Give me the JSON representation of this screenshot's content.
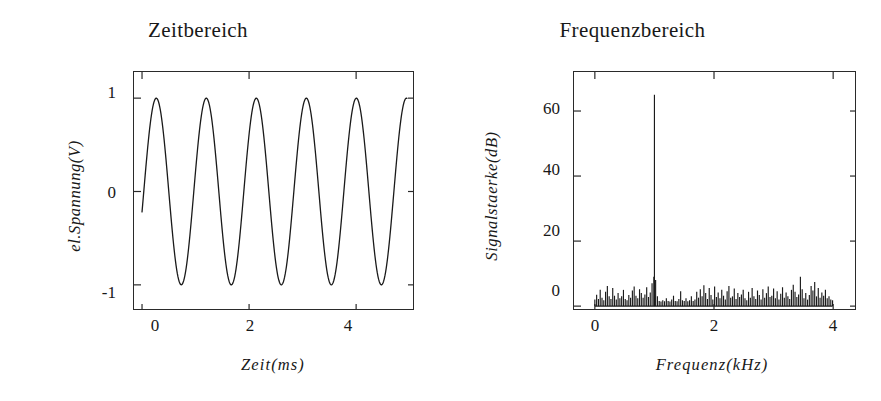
{
  "figure": {
    "background": "#ffffff",
    "ink_color": "#1a1a1a"
  },
  "chart_data": [
    {
      "type": "line",
      "id": "time-domain",
      "title": "Zeitbereich",
      "xlabel": "Zeit(ms)",
      "ylabel": "el.Spannung(V)",
      "xlim": [
        -0.15,
        5.1
      ],
      "ylim": [
        -1.28,
        1.28
      ],
      "xticks": [
        0,
        2,
        4
      ],
      "xticklabels": [
        "0",
        "2",
        "4"
      ],
      "yticks": [
        1,
        0,
        -1
      ],
      "yticklabels": [
        "1",
        "0",
        "-1"
      ],
      "grid": false,
      "legend": "none",
      "series": [
        {
          "name": "signal",
          "description": "sinusoidal voltage, amplitude 1 V, frequency about 1.07 kHz, roughly 5 periods across 5 ms, starting near -0.22 V at t=0",
          "amplitude": 1.0,
          "frequency_khz": 1.07,
          "phase_rad": -0.22,
          "t_start_ms": 0.0,
          "t_end_ms": 4.95,
          "samples": 420,
          "color": "#1a1a1a"
        }
      ]
    },
    {
      "type": "bar",
      "id": "frequency-domain",
      "title": "Frequenzbereich",
      "xlabel": "Frequenz(kHz)",
      "ylabel": "Signalstaerke(dB)",
      "xlim": [
        -0.35,
        4.4
      ],
      "ylim": [
        -1.5,
        72
      ],
      "xticks": [
        0,
        2,
        4
      ],
      "xticklabels": [
        "0",
        "2",
        "4"
      ],
      "yticks": [
        0,
        20,
        40,
        60
      ],
      "yticklabels": [
        "0",
        "20",
        "40",
        "60"
      ],
      "grid": false,
      "legend": "none",
      "peak": {
        "frequency_khz": 1.0,
        "value_db": 65
      },
      "noise_floor_db": 1.5,
      "x": [
        0.0,
        0.03,
        0.06,
        0.09,
        0.12,
        0.15,
        0.18,
        0.21,
        0.24,
        0.27,
        0.3,
        0.33,
        0.36,
        0.39,
        0.42,
        0.45,
        0.48,
        0.51,
        0.54,
        0.57,
        0.6,
        0.63,
        0.66,
        0.69,
        0.72,
        0.75,
        0.78,
        0.81,
        0.84,
        0.87,
        0.9,
        0.93,
        0.96,
        0.99,
        1.0,
        1.02,
        1.05,
        1.08,
        1.11,
        1.14,
        1.17,
        1.2,
        1.23,
        1.26,
        1.29,
        1.32,
        1.35,
        1.38,
        1.41,
        1.44,
        1.47,
        1.5,
        1.53,
        1.56,
        1.59,
        1.62,
        1.65,
        1.68,
        1.71,
        1.74,
        1.77,
        1.8,
        1.83,
        1.86,
        1.89,
        1.92,
        1.95,
        1.98,
        2.01,
        2.04,
        2.07,
        2.1,
        2.13,
        2.16,
        2.19,
        2.22,
        2.25,
        2.28,
        2.31,
        2.34,
        2.37,
        2.4,
        2.43,
        2.46,
        2.49,
        2.52,
        2.55,
        2.58,
        2.61,
        2.64,
        2.67,
        2.7,
        2.73,
        2.76,
        2.79,
        2.82,
        2.85,
        2.88,
        2.91,
        2.94,
        2.97,
        3.0,
        3.03,
        3.06,
        3.09,
        3.12,
        3.15,
        3.18,
        3.21,
        3.24,
        3.27,
        3.3,
        3.33,
        3.36,
        3.39,
        3.42,
        3.45,
        3.48,
        3.51,
        3.54,
        3.57,
        3.6,
        3.63,
        3.66,
        3.69,
        3.72,
        3.75,
        3.78,
        3.81,
        3.84,
        3.87,
        3.9,
        3.93,
        3.96,
        3.99
      ],
      "values": [
        2.0,
        3.5,
        2.2,
        5.0,
        2.6,
        1.8,
        4.4,
        6.2,
        3.0,
        2.2,
        5.6,
        3.2,
        2.0,
        4.0,
        2.4,
        3.0,
        5.0,
        2.2,
        1.8,
        3.4,
        2.6,
        4.8,
        6.0,
        3.2,
        2.4,
        5.2,
        4.0,
        2.6,
        3.6,
        5.8,
        2.8,
        4.2,
        7.0,
        9.0,
        65.0,
        8.0,
        3.0,
        1.6,
        1.4,
        1.8,
        1.5,
        2.4,
        1.6,
        1.4,
        2.0,
        3.2,
        1.6,
        1.5,
        2.2,
        4.6,
        1.8,
        1.6,
        2.4,
        1.5,
        1.8,
        3.0,
        1.6,
        2.0,
        4.4,
        2.6,
        5.2,
        3.0,
        6.4,
        4.0,
        2.2,
        5.6,
        3.4,
        2.0,
        6.0,
        2.8,
        4.2,
        2.4,
        5.0,
        3.2,
        2.0,
        4.6,
        6.2,
        2.6,
        3.0,
        5.4,
        2.2,
        4.0,
        2.8,
        3.6,
        5.0,
        2.4,
        1.8,
        4.4,
        2.6,
        5.6,
        3.0,
        2.2,
        4.8,
        3.4,
        2.0,
        5.2,
        2.6,
        4.0,
        6.0,
        2.8,
        3.2,
        5.4,
        2.4,
        4.6,
        2.0,
        3.8,
        5.8,
        2.6,
        4.2,
        3.0,
        2.2,
        5.0,
        6.6,
        4.4,
        2.8,
        3.6,
        9.0,
        5.2,
        2.4,
        4.0,
        2.0,
        3.4,
        6.2,
        4.8,
        7.4,
        3.0,
        5.6,
        2.6,
        4.2,
        3.2,
        5.0,
        2.4,
        3.0,
        2.0,
        1.8
      ]
    }
  ]
}
